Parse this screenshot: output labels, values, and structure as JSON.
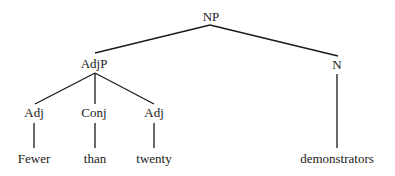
{
  "diagram": {
    "type": "syntax-tree",
    "nodes": {
      "np": "NP",
      "adjp": "AdjP",
      "n": "N",
      "adj1": "Adj",
      "conj": "Conj",
      "adj2": "Adj",
      "word_fewer": "Fewer",
      "word_than": "than",
      "word_twenty": "twenty",
      "word_demonstrators": "demonstrators"
    },
    "edges": [
      [
        "np",
        "adjp"
      ],
      [
        "np",
        "n"
      ],
      [
        "adjp",
        "adj1"
      ],
      [
        "adjp",
        "conj"
      ],
      [
        "adjp",
        "adj2"
      ],
      [
        "adj1",
        "word_fewer"
      ],
      [
        "conj",
        "word_than"
      ],
      [
        "adj2",
        "word_twenty"
      ],
      [
        "n",
        "word_demonstrators"
      ]
    ]
  }
}
